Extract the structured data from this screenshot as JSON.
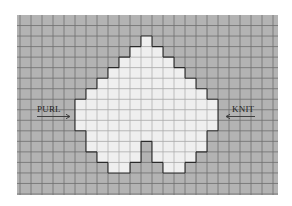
{
  "diagram": {
    "type": "knitting-chart",
    "grid": {
      "columns": 24,
      "rows": 17,
      "background_color": "#b3b3b3",
      "line_color": "#6e6e6e",
      "filled_color": "#efefef",
      "filled_line_color": "#aaaaaa",
      "outline_color": "#2a2a2a"
    },
    "shape_rows": [
      {
        "row": 2,
        "spans": [
          [
            11,
            11
          ]
        ]
      },
      {
        "row": 3,
        "spans": [
          [
            10,
            12
          ]
        ]
      },
      {
        "row": 4,
        "spans": [
          [
            9,
            13
          ]
        ]
      },
      {
        "row": 5,
        "spans": [
          [
            8,
            14
          ]
        ]
      },
      {
        "row": 6,
        "spans": [
          [
            7,
            15
          ]
        ]
      },
      {
        "row": 7,
        "spans": [
          [
            6,
            16
          ]
        ]
      },
      {
        "row": 8,
        "spans": [
          [
            5,
            17
          ]
        ]
      },
      {
        "row": 9,
        "spans": [
          [
            5,
            17
          ]
        ]
      },
      {
        "row": 10,
        "spans": [
          [
            5,
            17
          ]
        ]
      },
      {
        "row": 11,
        "spans": [
          [
            6,
            16
          ]
        ]
      },
      {
        "row": 12,
        "spans": [
          [
            6,
            10
          ],
          [
            12,
            16
          ]
        ]
      },
      {
        "row": 13,
        "spans": [
          [
            7,
            10
          ],
          [
            12,
            15
          ]
        ]
      },
      {
        "row": 14,
        "spans": [
          [
            8,
            9
          ],
          [
            13,
            14
          ]
        ]
      }
    ],
    "labels": {
      "left": {
        "text": "PURL",
        "arrow_direction": "right"
      },
      "right": {
        "text": "KNIT",
        "arrow_direction": "left"
      }
    }
  }
}
